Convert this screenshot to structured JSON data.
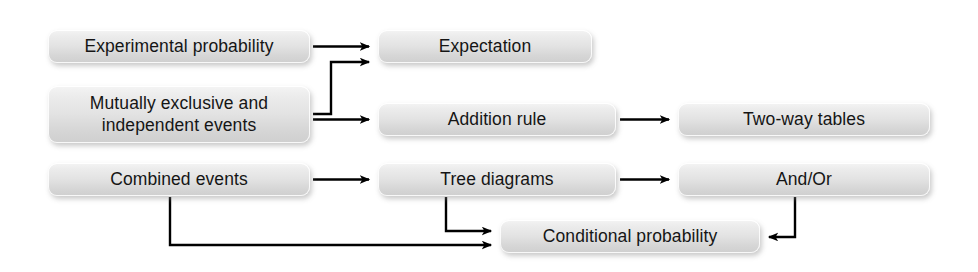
{
  "diagram": {
    "type": "flowchart",
    "background_color": "#ffffff",
    "node_fill_top": "#f4f4f4",
    "node_fill_bottom": "#cfcfcf",
    "node_text_color": "#151515",
    "arrow_color": "#000000",
    "nodes": [
      {
        "id": "experimental-probability",
        "label": "Experimental probability",
        "x": 48,
        "y": 30,
        "w": 262,
        "h": 33
      },
      {
        "id": "expectation",
        "label": "Expectation",
        "x": 378,
        "y": 30,
        "w": 214,
        "h": 33
      },
      {
        "id": "mutually-exclusive-independent-events",
        "label_line1": "Mutually exclusive and",
        "label_line2": "independent events",
        "x": 48,
        "y": 86,
        "w": 262,
        "h": 57
      },
      {
        "id": "addition-rule",
        "label": "Addition rule",
        "x": 378,
        "y": 103,
        "w": 238,
        "h": 33
      },
      {
        "id": "two-way-tables",
        "label": "Two-way tables",
        "x": 678,
        "y": 103,
        "w": 252,
        "h": 33
      },
      {
        "id": "combined-events",
        "label": "Combined events",
        "x": 48,
        "y": 163,
        "w": 262,
        "h": 33
      },
      {
        "id": "tree-diagrams",
        "label": "Tree diagrams",
        "x": 378,
        "y": 163,
        "w": 238,
        "h": 33
      },
      {
        "id": "and-or",
        "label": "And/Or",
        "x": 678,
        "y": 163,
        "w": 252,
        "h": 33
      },
      {
        "id": "conditional-probability",
        "label": "Conditional probability",
        "x": 500,
        "y": 220,
        "w": 260,
        "h": 33
      }
    ],
    "edges": [
      {
        "id": "edge-experimental-to-expectation",
        "from": "experimental-probability",
        "to": "expectation",
        "style": "straight"
      },
      {
        "id": "edge-mutually-to-expectation",
        "from": "mutually-exclusive-independent-events",
        "to": "expectation",
        "style": "elbow-up"
      },
      {
        "id": "edge-mutually-to-addition-rule",
        "from": "mutually-exclusive-independent-events",
        "to": "addition-rule",
        "style": "straight"
      },
      {
        "id": "edge-addition-rule-to-two-way-tables",
        "from": "addition-rule",
        "to": "two-way-tables",
        "style": "straight"
      },
      {
        "id": "edge-combined-to-tree-diagrams",
        "from": "combined-events",
        "to": "tree-diagrams",
        "style": "straight"
      },
      {
        "id": "edge-tree-diagrams-to-and-or",
        "from": "tree-diagrams",
        "to": "and-or",
        "style": "straight"
      },
      {
        "id": "edge-tree-diagrams-to-conditional",
        "from": "tree-diagrams",
        "to": "conditional-probability",
        "style": "elbow-down"
      },
      {
        "id": "edge-combined-to-conditional",
        "from": "combined-events",
        "to": "conditional-probability",
        "style": "elbow-down-long"
      },
      {
        "id": "edge-and-or-to-conditional",
        "from": "and-or",
        "to": "conditional-probability",
        "style": "elbow-down-left"
      }
    ]
  }
}
